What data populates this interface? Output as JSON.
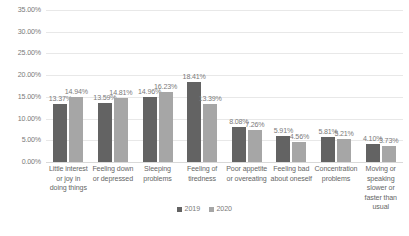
{
  "chart_data": {
    "type": "bar",
    "title": "",
    "subtitle": "",
    "xlabel": "",
    "ylabel": "",
    "ylim": [
      0,
      35
    ],
    "grid": true,
    "legend_position": "bottom",
    "y_ticks": [
      "0.00%",
      "5.00%",
      "10.00%",
      "15.00%",
      "20.00%",
      "25.00%",
      "30.00%",
      "35.00%"
    ],
    "y_tick_values": [
      0,
      5,
      10,
      15,
      20,
      25,
      30,
      35
    ],
    "categories": [
      "Little interest or joy in doing things",
      "Feeling down or depressed",
      "Sleeping problems",
      "Feeling of tiredness",
      "Poor appetite or overeating",
      "Feeling bad about oneself",
      "Concentration problems",
      "Moving or speaking slower or faster than usual"
    ],
    "series": [
      {
        "name": "2019",
        "color": "#636363",
        "values": [
          13.37,
          13.59,
          14.96,
          18.41,
          8.08,
          5.91,
          5.81,
          4.1
        ],
        "labels": [
          "13.37%",
          "13.59%",
          "14.96%",
          "18.41%",
          "8.08%",
          "5.91%",
          "5.81%",
          "4.10%"
        ]
      },
      {
        "name": "2020",
        "color": "#a6a6a6",
        "values": [
          14.94,
          14.81,
          16.23,
          13.39,
          7.26,
          4.56,
          5.21,
          3.73
        ],
        "labels": [
          "14.94%",
          "14.81%",
          "16.23%",
          "13.39%",
          "7.26%",
          "4.56%",
          "5.21%",
          "3.73%"
        ]
      }
    ]
  },
  "legend": {
    "items": [
      {
        "label": "2019",
        "color": "#636363"
      },
      {
        "label": "2020",
        "color": "#a6a6a6"
      }
    ]
  }
}
